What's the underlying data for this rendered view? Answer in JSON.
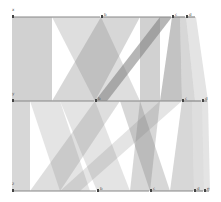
{
  "chart_data": {
    "type": "parallel-sets",
    "title": "",
    "axes": [
      {
        "name": "x",
        "y": 17,
        "categories": [
          {
            "label": "a",
            "x0": 12,
            "x1": 101
          },
          {
            "label": "b",
            "x0": 101,
            "x1": 172
          },
          {
            "label": "c",
            "x0": 172,
            "x1": 186
          },
          {
            "label": "d",
            "x0": 186,
            "x1": 196
          }
        ]
      },
      {
        "name": "y",
        "y": 101,
        "categories": [
          {
            "label": "a",
            "x0": 12,
            "x1": 95
          },
          {
            "label": "b",
            "x0": 95,
            "x1": 182
          },
          {
            "label": "c",
            "x0": 182,
            "x1": 202
          },
          {
            "label": "d",
            "x0": 202,
            "x1": 208
          }
        ]
      },
      {
        "name": "z",
        "y": 191,
        "categories": [
          {
            "label": "a",
            "x0": 12,
            "x1": 97
          },
          {
            "label": "b",
            "x0": 97,
            "x1": 150
          },
          {
            "label": "c",
            "x0": 150,
            "x1": 194
          },
          {
            "label": "d",
            "x0": 194,
            "x1": 204
          },
          {
            "label": "e",
            "x0": 204,
            "x1": 210
          }
        ]
      }
    ],
    "ribbons_top": [
      {
        "a0": 12,
        "a1": 52,
        "b0": 12,
        "b1": 52,
        "o": 0.35
      },
      {
        "a0": 52,
        "a1": 101,
        "b0": 95,
        "b1": 140,
        "o": 0.25
      },
      {
        "a0": 101,
        "a1": 140,
        "b0": 52,
        "b1": 95,
        "o": 0.3
      },
      {
        "a0": 140,
        "a1": 160,
        "b0": 140,
        "b1": 160,
        "o": 0.35
      },
      {
        "a0": 160,
        "a1": 172,
        "b0": 95,
        "b1": 107,
        "o": 0.55
      },
      {
        "a0": 172,
        "a1": 180,
        "b0": 160,
        "b1": 182,
        "o": 0.45
      },
      {
        "a0": 180,
        "a1": 186,
        "b0": 182,
        "b1": 195,
        "o": 0.3
      },
      {
        "a0": 186,
        "a1": 196,
        "b0": 195,
        "b1": 208,
        "o": 0.2
      }
    ],
    "ribbons_bottom": [
      {
        "a0": 12,
        "a1": 30,
        "b0": 12,
        "b1": 30,
        "o": 0.3
      },
      {
        "a0": 30,
        "a1": 60,
        "b0": 60,
        "b1": 90,
        "o": 0.2
      },
      {
        "a0": 60,
        "a1": 95,
        "b0": 97,
        "b1": 130,
        "o": 0.2
      },
      {
        "a0": 95,
        "a1": 120,
        "b0": 30,
        "b1": 60,
        "o": 0.25
      },
      {
        "a0": 120,
        "a1": 140,
        "b0": 150,
        "b1": 170,
        "o": 0.3
      },
      {
        "a0": 140,
        "a1": 160,
        "b0": 130,
        "b1": 150,
        "o": 0.3
      },
      {
        "a0": 160,
        "a1": 182,
        "b0": 60,
        "b1": 80,
        "o": 0.2
      },
      {
        "a0": 182,
        "a1": 192,
        "b0": 170,
        "b1": 194,
        "o": 0.3
      },
      {
        "a0": 192,
        "a1": 202,
        "b0": 194,
        "b1": 204,
        "o": 0.25
      },
      {
        "a0": 202,
        "a1": 208,
        "b0": 204,
        "b1": 210,
        "o": 0.2
      }
    ]
  }
}
